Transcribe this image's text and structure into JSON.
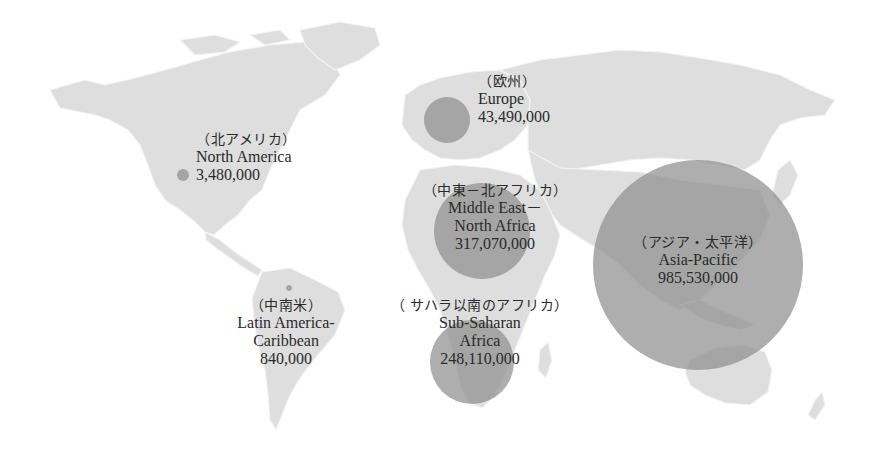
{
  "chart_data": {
    "type": "bubble-map",
    "title": "",
    "regions": [
      {
        "id": "europe",
        "name_ja": "（欧州）",
        "name_en": "Europe",
        "name_en_line2": "",
        "value": 43490000,
        "value_label": "43,490,000",
        "circle": {
          "cx": 447,
          "cy": 120,
          "r": 23
        }
      },
      {
        "id": "north-america",
        "name_ja": "（北アメリカ）",
        "name_en": "North America",
        "name_en_line2": "",
        "value": 3480000,
        "value_label": "3,480,000",
        "circle": {
          "cx": 183,
          "cy": 175,
          "r": 6
        }
      },
      {
        "id": "middle-east-north-africa",
        "name_ja": "（中東－北アフリカ）",
        "name_en": "Middle East－",
        "name_en_line2": "North Africa",
        "value": 317070000,
        "value_label": "317,070,000",
        "circle": {
          "cx": 482,
          "cy": 231,
          "r": 48
        }
      },
      {
        "id": "asia-pacific",
        "name_ja": "（アジア・太平洋）",
        "name_en": "Asia-Pacific",
        "name_en_line2": "",
        "value": 985530000,
        "value_label": "985,530,000",
        "circle": {
          "cx": 698,
          "cy": 265,
          "r": 105
        }
      },
      {
        "id": "latin-america-caribbean",
        "name_ja": "（中南米）",
        "name_en": "Latin America-",
        "name_en_line2": "Caribbean",
        "value": 840000,
        "value_label": "840,000",
        "circle": {
          "cx": 289,
          "cy": 288,
          "r": 3
        }
      },
      {
        "id": "sub-saharan-africa",
        "name_ja": "（ サハラ以南のアフリカ）",
        "name_en": "Sub-Saharan",
        "name_en_line2": "Africa",
        "value": 248110000,
        "value_label": "248,110,000",
        "circle": {
          "cx": 472,
          "cy": 362,
          "r": 42
        }
      }
    ],
    "colors": {
      "land": "#dedede",
      "bubble": "#8f8f8f",
      "background": "#ffffff",
      "text": "#2a2a2a"
    }
  }
}
